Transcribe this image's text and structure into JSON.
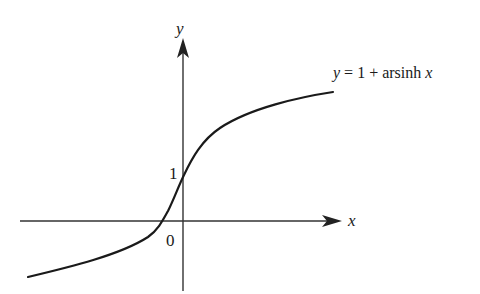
{
  "diagram": {
    "type": "function-graph",
    "axes": {
      "x_label": "x",
      "y_label": "y",
      "origin_label": "0",
      "y_tick_label": "1"
    },
    "curve": {
      "equation_label_y": "y",
      "equation_label_rest": " = 1 + arsinh ",
      "equation_label_x": "x",
      "color": "#1a1a1a"
    },
    "colors": {
      "background": "#ffffff",
      "axis": "#333333",
      "text": "#1a1a1a"
    }
  }
}
